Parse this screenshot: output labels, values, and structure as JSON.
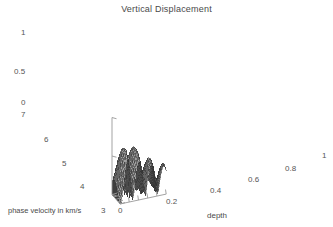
{
  "figure": {
    "title": "Vertical Displacement",
    "background_color": "#ffffff",
    "axis_color": "#999999",
    "mesh_color": "#333333",
    "text_color": "#4a4a4a"
  },
  "axes": {
    "z": {
      "label": "",
      "ticks": [
        "1",
        "0.5",
        "0"
      ],
      "range": [
        0,
        1
      ]
    },
    "y": {
      "label": "phase velocity in km/s",
      "ticks": [
        "7",
        "6",
        "5",
        "4",
        "3"
      ],
      "range": [
        7,
        3
      ]
    },
    "x": {
      "label": "depth",
      "ticks": [
        "0",
        "0.2",
        "0.4",
        "0.6",
        "0.8",
        "1"
      ],
      "range": [
        0,
        1
      ]
    }
  },
  "chart_data": {
    "type": "surface",
    "title": "Vertical Displacement",
    "xlabel": "depth",
    "ylabel": "phase velocity in km/s",
    "zlabel": "",
    "xlim": [
      0,
      1
    ],
    "ylim": [
      7,
      3
    ],
    "zlim": [
      0,
      1
    ],
    "xticks": [
      0,
      0.2,
      0.4,
      0.6,
      0.8,
      1
    ],
    "yticks": [
      7,
      6,
      5,
      4,
      3
    ],
    "zticks": [
      0,
      0.5,
      1
    ],
    "grid": false,
    "legend": "none",
    "render_style": "wireframe-mesh",
    "nx": 44,
    "ny": 26,
    "surface_model": {
      "formula": "z = A(y) * exp(-d(y)*x) * cos(w(y)*x + p(y))",
      "ridge_count": 3,
      "notes": "amplitude decays with depth; oscillation frequency increases as phase velocity decreases"
    },
    "ridges": [
      {
        "name": "ridge-1",
        "depth_approx": 0.3,
        "peak_z_approx": 1.0
      },
      {
        "name": "ridge-2",
        "depth_approx": 0.6,
        "peak_z_approx": 0.85
      },
      {
        "name": "ridge-3",
        "depth_approx": 0.88,
        "peak_z_approx": 0.92
      }
    ],
    "troughs": [
      {
        "name": "trough-1",
        "depth_approx": 0.45,
        "z_approx": 0.0
      },
      {
        "name": "trough-2",
        "depth_approx": 0.75,
        "z_approx": 0.05
      }
    ]
  }
}
